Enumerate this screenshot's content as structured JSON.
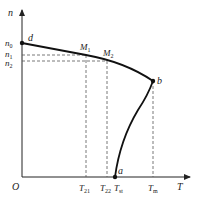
{
  "diagram": {
    "axes": {
      "x_label": "T",
      "y_label": "n",
      "origin_label": "O"
    },
    "y_ticks": [
      {
        "base": "n",
        "sub": "0",
        "y": 43
      },
      {
        "base": "n",
        "sub": "1",
        "y": 55
      },
      {
        "base": "n",
        "sub": "2",
        "y": 61
      }
    ],
    "x_ticks": [
      {
        "base": "T",
        "sub": "21",
        "x": 86
      },
      {
        "base": "T",
        "sub": "22",
        "x": 107
      },
      {
        "base": "T",
        "sub": "st",
        "x": 118
      },
      {
        "base": "T",
        "sub": "m",
        "x": 153
      }
    ],
    "points": [
      {
        "name": "d",
        "label": "d"
      },
      {
        "name": "M1",
        "label": "M",
        "sub": "1"
      },
      {
        "name": "M2",
        "label": "M",
        "sub": "2"
      },
      {
        "name": "b",
        "label": "b"
      },
      {
        "name": "a",
        "label": "a"
      }
    ],
    "colors": {
      "curve": "#111111",
      "dashed": "#555555",
      "axis": "#222222"
    }
  }
}
